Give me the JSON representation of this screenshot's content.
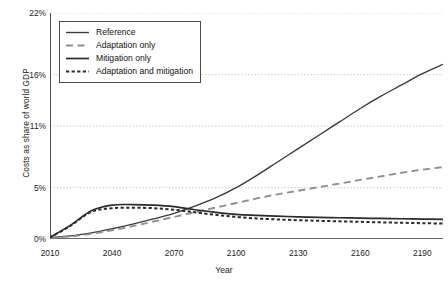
{
  "chart_data": {
    "type": "line",
    "title": "",
    "xlabel": "Year",
    "ylabel": "Costs as share of world GDP",
    "xlim": [
      2010,
      2200
    ],
    "ylim": [
      0,
      22
    ],
    "xticks": [
      2010,
      2040,
      2070,
      2100,
      2130,
      2160,
      2190
    ],
    "xtick_labels": [
      "2010",
      "2040",
      "2070",
      "2100",
      "2130",
      "2160",
      "2190"
    ],
    "yticks": [
      0,
      5,
      11,
      16,
      22
    ],
    "ytick_labels": [
      "0%",
      "5%",
      "11%",
      "16%",
      "22%"
    ],
    "grid": "horizontal-dotted",
    "legend_position": "top-left",
    "x": [
      2010,
      2020,
      2030,
      2040,
      2050,
      2060,
      2070,
      2080,
      2090,
      2100,
      2110,
      2120,
      2130,
      2140,
      2150,
      2160,
      2170,
      2180,
      2190,
      2200
    ],
    "series": [
      {
        "name": "Reference",
        "style": "solid-thin",
        "color": "#3a3a3a",
        "values": [
          0.15,
          0.3,
          0.6,
          1.0,
          1.45,
          1.95,
          2.5,
          3.2,
          4.0,
          5.0,
          6.2,
          7.5,
          8.8,
          10.1,
          11.4,
          12.7,
          13.9,
          15.0,
          16.1,
          17.0
        ]
      },
      {
        "name": "Adaptation only",
        "style": "dashed",
        "color": "#8f8f8f",
        "values": [
          0.12,
          0.25,
          0.5,
          0.85,
          1.25,
          1.7,
          2.15,
          2.6,
          3.05,
          3.5,
          3.95,
          4.35,
          4.7,
          5.05,
          5.4,
          5.75,
          6.1,
          6.45,
          6.75,
          7.0
        ]
      },
      {
        "name": "Mitigation only",
        "style": "solid-thick",
        "color": "#2b2b2b",
        "values": [
          0.15,
          1.35,
          2.75,
          3.3,
          3.35,
          3.3,
          3.15,
          2.85,
          2.6,
          2.4,
          2.3,
          2.22,
          2.16,
          2.11,
          2.07,
          2.03,
          2.0,
          1.97,
          1.94,
          1.92
        ]
      },
      {
        "name": "Adaptation and mitigation",
        "style": "dotted-thick",
        "color": "#2b2b2b",
        "values": [
          0.15,
          1.3,
          2.65,
          3.0,
          3.05,
          3.0,
          2.85,
          2.6,
          2.35,
          2.15,
          2.0,
          1.9,
          1.83,
          1.77,
          1.72,
          1.67,
          1.62,
          1.58,
          1.54,
          1.5
        ]
      }
    ]
  },
  "legend": {
    "items": [
      {
        "label": "Reference"
      },
      {
        "label": "Adaptation only"
      },
      {
        "label": "Mitigation only"
      },
      {
        "label": "Adaptation and mitigation"
      }
    ]
  }
}
